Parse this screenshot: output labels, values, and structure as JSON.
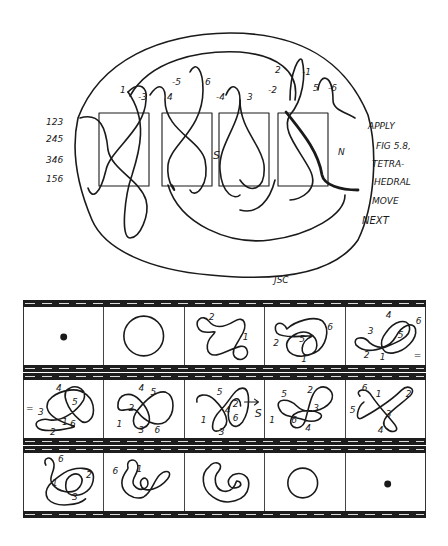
{
  "figure": {
    "type": "hand-drawn knot theory diagram with three film-strip sequences",
    "main_drawing": {
      "row_labels": [
        "123",
        "245",
        "346",
        "156"
      ],
      "strand_labels_top": [
        "1",
        "-3",
        "4",
        "-5",
        "6",
        "-4",
        "3",
        "-2",
        "2",
        "-1",
        "5",
        "-6"
      ],
      "side_markers": [
        "S",
        "N"
      ],
      "boxes_count": 4,
      "instruction_lines": [
        "APPLY",
        "FIG 5.8,",
        "TETRA-",
        "HEDRAL",
        "MOVE",
        "NEXT"
      ],
      "signature": "JSC"
    },
    "film_strips": [
      {
        "name": "strip-1",
        "frames": [
          {
            "content": "dot",
            "labels": []
          },
          {
            "content": "circle",
            "labels": []
          },
          {
            "content": "curve",
            "labels": [
              "2",
              "1"
            ]
          },
          {
            "content": "curve",
            "labels": [
              "2",
              "5",
              "6",
              "1"
            ]
          },
          {
            "content": "curve",
            "labels": [
              "4",
              "3",
              "5",
              "6",
              "2",
              "1",
              "="
            ]
          }
        ]
      },
      {
        "name": "strip-2",
        "frames": [
          {
            "content": "curve",
            "labels": [
              "=",
              "4",
              "3",
              "5",
              "1",
              "6",
              "2"
            ]
          },
          {
            "content": "curve",
            "labels": [
              "4",
              "5",
              "2",
              "1",
              "3",
              "6"
            ]
          },
          {
            "content": "curve",
            "labels": [
              "5",
              "4",
              "2",
              "6",
              "1",
              "3",
              "S"
            ]
          },
          {
            "content": "curve",
            "labels": [
              "5",
              "2",
              "3",
              "1",
              "6",
              "4"
            ]
          },
          {
            "content": "curve",
            "labels": [
              "6",
              "1",
              "2",
              "5",
              "3",
              "4"
            ]
          }
        ]
      },
      {
        "name": "strip-3",
        "frames": [
          {
            "content": "curve",
            "labels": [
              "6",
              "1",
              "2",
              "3"
            ]
          },
          {
            "content": "curve",
            "labels": [
              "6",
              "1"
            ]
          },
          {
            "content": "spiral",
            "labels": []
          },
          {
            "content": "circle",
            "labels": []
          },
          {
            "content": "dot",
            "labels": []
          }
        ]
      }
    ]
  }
}
